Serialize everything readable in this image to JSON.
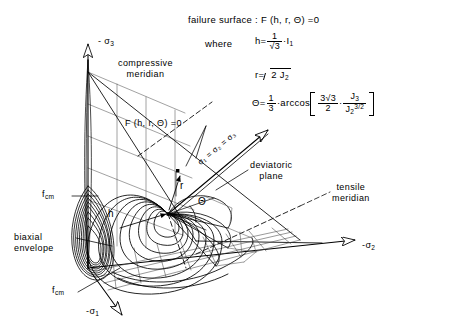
{
  "figure": {
    "title": "failure surface : F (h, r, Θ) =0",
    "where_label": "where"
  },
  "formulas": {
    "h": {
      "lhs": "h",
      "eq": "=",
      "num": "1",
      "den": "√3",
      "dot": "·",
      "rhs": "I",
      "rhs_sub": "1"
    },
    "r": {
      "lhs": "r",
      "eq": "=",
      "radicand": "2 J",
      "radicand_sub": "2"
    },
    "theta": {
      "lhs": "Θ",
      "eq": "=",
      "num": "1",
      "den": "3",
      "dot": "·",
      "fn": "arccos",
      "b_num": "3√3",
      "b_den": "2",
      "b_dot": "·",
      "frac2_num": "J",
      "frac2_num_sub": "3",
      "frac2_den": "J",
      "frac2_den_sub": "2",
      "frac2_den_sup": "3/2"
    }
  },
  "axes": [
    {
      "name": "sigma-3-axis",
      "label": "- σ",
      "sub": "3"
    },
    {
      "name": "sigma-2-axis",
      "label": "-σ",
      "sub": "2"
    },
    {
      "name": "sigma-1-axis",
      "label": "-σ",
      "sub": "1"
    },
    {
      "name": "hydrostatic-axis",
      "label": "σ₁ = σ₂ = σ₃"
    }
  ],
  "annotations": {
    "compressive_meridian": "compressive\nmeridian",
    "surface_eq": "F (h, r, Θ) =0",
    "deviatoric_plane": "deviatoric\nplane",
    "tensile_meridian": "tensile\nmeridian",
    "biaxial_envelope": "biaxial\nenvelope",
    "fcm_upper": {
      "label": "f",
      "sub": "cm"
    },
    "fcm_lower": {
      "label": "f",
      "sub": "cm"
    },
    "h_marker": "h",
    "r_marker": "r",
    "theta_marker": "Θ"
  },
  "style": {
    "ink": "#000000",
    "paper": "#ffffff",
    "mesh": "#3a3a3a"
  }
}
